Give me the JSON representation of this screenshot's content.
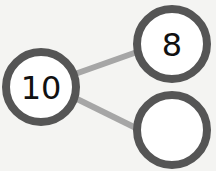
{
  "diagram": {
    "type": "number-bond",
    "whole": {
      "value": "10"
    },
    "parts": [
      {
        "value": "8"
      },
      {
        "value": ""
      }
    ],
    "colors": {
      "background": "#f4f4f2",
      "circle_stroke": "#555555",
      "connector": "#a6a6a6",
      "circle_fill": "#ffffff",
      "text": "#111111"
    }
  }
}
